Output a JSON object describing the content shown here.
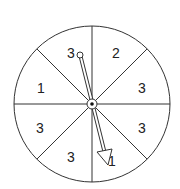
{
  "spinner": {
    "sections": [
      {
        "label": "2"
      },
      {
        "label": "3"
      },
      {
        "label": "3"
      },
      {
        "label": "1"
      },
      {
        "label": "3"
      },
      {
        "label": "3"
      },
      {
        "label": "1"
      },
      {
        "label": "3"
      }
    ],
    "stroke_color": "#333333",
    "background": "#ffffff"
  }
}
